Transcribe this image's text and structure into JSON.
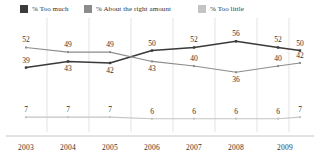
{
  "legend": {
    "items": [
      {
        "label": "% Too much",
        "color": "#3a3a3a",
        "icon": "square-swatch-icon"
      },
      {
        "label": "% About the right amount",
        "color": "#8c8c8c",
        "icon": "square-swatch-icon"
      },
      {
        "label": "% Too little",
        "color": "#c4c4c4",
        "icon": "square-swatch-icon"
      }
    ]
  },
  "chart_data": {
    "type": "line",
    "title": "",
    "subtitle": "",
    "xlabel": "",
    "ylabel": "",
    "x": [
      2003,
      2004,
      2005,
      2006,
      2007,
      2008,
      2009,
      2009
    ],
    "categories": [
      "2003",
      "2004",
      "2005",
      "2006",
      "2007",
      "2008",
      "2009",
      "2009"
    ],
    "tick_labels": [
      "2003",
      "2004",
      "2005",
      "2006",
      "2007",
      "2008",
      "2009"
    ],
    "series": [
      {
        "name": "% Too much",
        "color": "#3a3a3a",
        "values": [
          39,
          43,
          42,
          50,
          52,
          56,
          52,
          50
        ],
        "label_positions": [
          "above",
          "below",
          "below",
          "above",
          "above",
          "above",
          "above",
          "above"
        ]
      },
      {
        "name": "% About the right amount",
        "color": "#8c8c8c",
        "values": [
          52,
          49,
          49,
          43,
          40,
          36,
          40,
          42
        ],
        "label_positions": [
          "above",
          "above",
          "above",
          "below",
          "above",
          "below",
          "above",
          "above"
        ]
      },
      {
        "name": "% Too little",
        "color": "#c4c4c4",
        "values": [
          7,
          7,
          7,
          6,
          6,
          6,
          6,
          7
        ],
        "label_positions": [
          "above",
          "above",
          "above",
          "above",
          "above",
          "above",
          "above",
          "above"
        ]
      }
    ],
    "ylim": [
      0,
      60
    ],
    "grid": "vertical",
    "legend_position": "top",
    "axis_line": "bottom"
  }
}
